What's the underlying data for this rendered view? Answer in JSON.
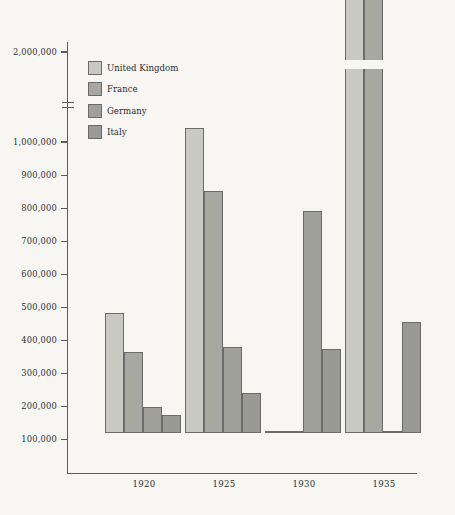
{
  "chart_data": {
    "type": "bar",
    "title": "",
    "xlabel": "",
    "ylabel": "",
    "categories": [
      "1920",
      "1925",
      "1930",
      "1935"
    ],
    "series": [
      {
        "name": "United Kingdom",
        "color": "#c9c9c4",
        "values": [
          363000,
          920000,
          1520000,
          2030000
        ]
      },
      {
        "name": "France",
        "color": "#a8a8a3",
        "values": [
          245000,
          730000,
          1600000,
          2180000
        ]
      },
      {
        "name": "Germany",
        "color": "#a0a09b",
        "values": [
          80000,
          260000,
          670000,
          1220000
        ]
      },
      {
        "name": "Italy",
        "color": "#9a9a95",
        "values": [
          55000,
          120000,
          255000,
          335000
        ]
      }
    ],
    "ylim": [
      0,
      2250000
    ],
    "axis_break": {
      "from": 1050000,
      "to": 1950000
    },
    "yticks": [
      {
        "value": 100000,
        "label": "100,000"
      },
      {
        "value": 200000,
        "label": "200,000"
      },
      {
        "value": 300000,
        "label": "300,000"
      },
      {
        "value": 400000,
        "label": "400,000"
      },
      {
        "value": 500000,
        "label": "500,000"
      },
      {
        "value": 600000,
        "label": "600,000"
      },
      {
        "value": 700000,
        "label": "700,000"
      },
      {
        "value": 800000,
        "label": "800,000"
      },
      {
        "value": 900000,
        "label": "900,000"
      },
      {
        "value": 1000000,
        "label": "1,000,000"
      },
      {
        "value": 2000000,
        "label": "2,000,000"
      }
    ],
    "grid": false,
    "legend_position": "upper-left-inside"
  },
  "legend": {
    "items": [
      {
        "label": "United Kingdom",
        "swatch": "uk"
      },
      {
        "label": "France",
        "swatch": "fr"
      },
      {
        "label": "Germany",
        "swatch": "de"
      },
      {
        "label": "Italy",
        "swatch": "it"
      }
    ]
  },
  "axis": {
    "ticks": [
      "100,000",
      "200,000",
      "300,000",
      "400,000",
      "500,000",
      "600,000",
      "700,000",
      "800,000",
      "900,000",
      "1,000,000",
      "2,000,000"
    ],
    "categories": [
      "1920",
      "1925",
      "1930",
      "1935"
    ]
  }
}
